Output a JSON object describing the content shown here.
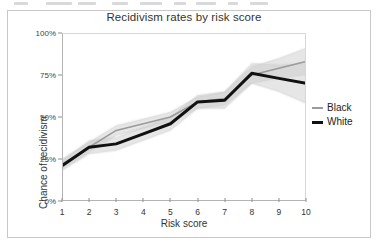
{
  "figure": {
    "title": "Recidivism rates by risk score"
  },
  "axes": {
    "y_label": "Chance of recidivism",
    "x_label": "Risk score",
    "y_ticks": [
      "0%",
      "25%",
      "50%",
      "75%",
      "100%"
    ],
    "x_ticks": [
      "1",
      "2",
      "3",
      "4",
      "5",
      "6",
      "7",
      "8",
      "9",
      "10"
    ]
  },
  "legend": {
    "entries": [
      {
        "label": "Black",
        "color": "#9a9a9a",
        "style": "thin-gray-line"
      },
      {
        "label": "White",
        "color": "#111111",
        "style": "thick-black-line"
      }
    ]
  },
  "colors": {
    "black_series": "#9a9a9a",
    "white_series": "#111111",
    "confidence_band": "#cccccc",
    "axis": "#8e8e8e",
    "frame": "#c8c8c8"
  },
  "chart_data": {
    "type": "line",
    "title": "Recidivism rates by risk score",
    "xlabel": "Risk score",
    "ylabel": "Chance of recidivism",
    "xlim": [
      1,
      10
    ],
    "ylim": [
      0,
      100
    ],
    "y_unit": "percent",
    "grid": false,
    "legend_position": "right",
    "x": [
      1,
      2,
      3,
      4,
      5,
      6,
      7,
      8,
      9,
      10
    ],
    "series": [
      {
        "name": "Black",
        "color": "#9a9a9a",
        "values": [
          22,
          32,
          42,
          46,
          50,
          59,
          61,
          75,
          79,
          83
        ],
        "ci_low": [
          19,
          29,
          39,
          43,
          47,
          55,
          57,
          70,
          73,
          75
        ],
        "ci_high": [
          25,
          35,
          45,
          49,
          53,
          62,
          65,
          80,
          85,
          91
        ]
      },
      {
        "name": "White",
        "color": "#111111",
        "values": [
          21,
          32,
          34,
          40,
          46,
          59,
          60,
          76,
          73,
          70
        ],
        "ci_low": [
          18,
          28,
          30,
          36,
          42,
          55,
          55,
          70,
          65,
          58
        ],
        "ci_high": [
          24,
          36,
          38,
          44,
          50,
          63,
          65,
          82,
          81,
          82
        ]
      }
    ]
  }
}
